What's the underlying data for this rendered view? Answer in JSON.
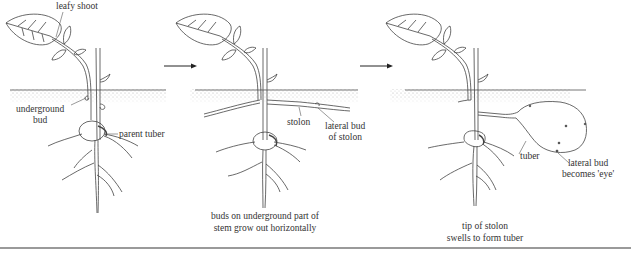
{
  "diagram": {
    "panels": [
      {
        "id": "stage-1",
        "labels": {
          "leafy_shoot": "leafy shoot",
          "underground_bud": "underground\nbud",
          "underground_bud_line1": "underground",
          "underground_bud_line2": "bud",
          "parent_tuber": "parent tuber"
        },
        "caption": ""
      },
      {
        "id": "stage-2",
        "labels": {
          "stolon": "stolon",
          "lateral_bud_line1": "lateral bud",
          "lateral_bud_line2": "of stolon"
        },
        "caption_line1": "buds on underground part of",
        "caption_line2": "stem grow out horizontally"
      },
      {
        "id": "stage-3",
        "labels": {
          "tuber": "tuber",
          "eye_line1": "lateral bud",
          "eye_line2": "becomes 'eye'"
        },
        "caption_line1": "tip of stolon",
        "caption_line2": "swells to form tuber"
      }
    ],
    "arrows": [
      {
        "from": "stage-1",
        "to": "stage-2",
        "icon": "right-arrow-icon"
      },
      {
        "from": "stage-2",
        "to": "stage-3",
        "icon": "right-arrow-icon"
      }
    ],
    "colors": {
      "line": "#444444",
      "soil": "#bdbdbd",
      "rule": "#9a9a9a"
    }
  }
}
